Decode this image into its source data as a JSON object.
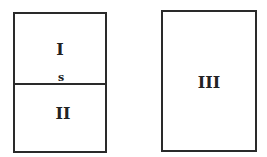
{
  "diagram": {
    "left_box": {
      "top_region_label": "I",
      "bottom_region_label": "II",
      "boundary_label": "s"
    },
    "right_box": {
      "label": "III"
    },
    "colors": {
      "stroke": "#2a2a2a",
      "background": "#ffffff"
    }
  }
}
